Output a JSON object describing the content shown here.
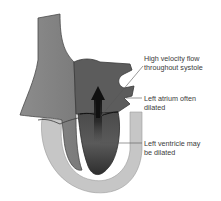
{
  "diagram": {
    "labels": [
      {
        "id": "high-velocity",
        "lines": [
          "High velocity flow",
          "throughout systole"
        ]
      },
      {
        "id": "left-atrium",
        "lines": [
          "Left atrium often",
          "dilated"
        ]
      },
      {
        "id": "left-ventricle",
        "lines": [
          "Left ventricle may",
          "be dilated"
        ]
      }
    ],
    "colors": {
      "myocardium_outer": "#c4c4c4",
      "right_chamber": "#8a8a8a",
      "left_chamber": "#555555",
      "outline": "#3c3c3c",
      "arrow": "#111111",
      "leader_line": "#555555",
      "text": "#3a3a3a"
    }
  }
}
